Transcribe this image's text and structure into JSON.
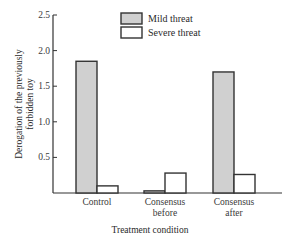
{
  "chart_data": {
    "type": "bar",
    "title": "",
    "xlabel": "Treatment condition",
    "ylabel": "Derogation of the previously forbidden toy",
    "ylabel_lines": [
      "Derogation of the previously",
      "forbidden toy"
    ],
    "ylim": [
      0,
      2.5
    ],
    "yticks": [
      0.5,
      1.0,
      1.5,
      2.0,
      2.5
    ],
    "ytick_labels": [
      "0.5",
      "1.0",
      "1.5",
      "2.0",
      "2.5"
    ],
    "grid": false,
    "legend_position": "upper right",
    "categories": [
      "Control",
      "Consensus before",
      "Consensus after"
    ],
    "category_lines": [
      [
        "Control"
      ],
      [
        "Consensus",
        "before"
      ],
      [
        "Consensus",
        "after"
      ]
    ],
    "series": [
      {
        "name": "Mild threat",
        "color": "#d0d0d0",
        "values": [
          1.85,
          0.03,
          1.7
        ]
      },
      {
        "name": "Severe threat",
        "color": "#ffffff",
        "values": [
          0.1,
          0.28,
          0.26
        ]
      }
    ]
  }
}
